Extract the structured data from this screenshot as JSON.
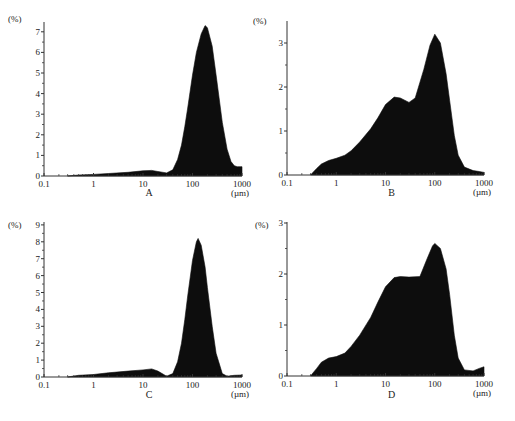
{
  "figure": {
    "panels": [
      "A",
      "B",
      "C",
      "D"
    ]
  },
  "chart_data": [
    {
      "id": "A",
      "type": "area",
      "title": "",
      "caption": "A",
      "xlabel": "(µm)",
      "ylabel": "(%)",
      "xscale": "log",
      "xlim": [
        0.1,
        1000
      ],
      "ylim": [
        0,
        7.5
      ],
      "xticks": [
        0.1,
        1,
        10,
        100,
        1000
      ],
      "xtick_labels": [
        "0.1",
        "1",
        "10",
        "100",
        "1000"
      ],
      "yticks": [
        0,
        1,
        2,
        3,
        4,
        5,
        6,
        7
      ],
      "grid": false,
      "x": [
        0.3,
        0.5,
        1,
        2,
        5,
        10,
        15,
        20,
        30,
        40,
        50,
        60,
        70,
        80,
        100,
        120,
        150,
        180,
        200,
        250,
        300,
        400,
        500,
        600,
        700,
        800,
        1000
      ],
      "values": [
        0.0,
        0.05,
        0.08,
        0.12,
        0.18,
        0.25,
        0.27,
        0.22,
        0.15,
        0.3,
        0.8,
        1.5,
        2.4,
        3.3,
        4.9,
        6.0,
        6.9,
        7.3,
        7.2,
        6.3,
        4.9,
        2.6,
        1.3,
        0.7,
        0.5,
        0.45,
        0.45
      ]
    },
    {
      "id": "B",
      "type": "area",
      "title": "",
      "caption": "B",
      "xlabel": "(µm)",
      "ylabel": "(%)",
      "xscale": "log",
      "xlim": [
        0.1,
        1000
      ],
      "ylim": [
        0,
        3.4
      ],
      "xticks": [
        0.1,
        1,
        10,
        100,
        1000
      ],
      "xtick_labels": [
        "0.1",
        "1",
        "10",
        "100",
        "1000"
      ],
      "yticks": [
        0,
        1,
        2,
        3
      ],
      "grid": false,
      "x": [
        0.3,
        0.4,
        0.5,
        0.7,
        1,
        1.5,
        2,
        3,
        5,
        7,
        10,
        15,
        20,
        30,
        40,
        60,
        80,
        100,
        130,
        170,
        200,
        250,
        300,
        400,
        600,
        800,
        1000
      ],
      "values": [
        0.0,
        0.15,
        0.25,
        0.33,
        0.38,
        0.45,
        0.55,
        0.75,
        1.05,
        1.3,
        1.6,
        1.77,
        1.75,
        1.65,
        1.75,
        2.4,
        2.95,
        3.2,
        3.0,
        2.3,
        1.7,
        0.9,
        0.45,
        0.18,
        0.1,
        0.08,
        0.06
      ]
    },
    {
      "id": "C",
      "type": "area",
      "title": "",
      "caption": "C",
      "xlabel": "(µm)",
      "ylabel": "(%)",
      "xscale": "log",
      "xlim": [
        0.1,
        1000
      ],
      "ylim": [
        0,
        9
      ],
      "xticks": [
        0.1,
        1,
        10,
        100,
        1000
      ],
      "xtick_labels": [
        "0.1",
        "1",
        "10",
        "100",
        "1000"
      ],
      "yticks": [
        0,
        1,
        2,
        3,
        4,
        5,
        6,
        7,
        8,
        9
      ],
      "grid": false,
      "x": [
        0.3,
        0.5,
        1,
        2,
        5,
        10,
        15,
        20,
        30,
        40,
        50,
        60,
        70,
        80,
        100,
        120,
        130,
        150,
        180,
        200,
        250,
        300,
        400,
        500,
        700,
        1000
      ],
      "values": [
        0.0,
        0.1,
        0.15,
        0.25,
        0.35,
        0.42,
        0.48,
        0.35,
        0.05,
        0.2,
        0.9,
        2.0,
        3.4,
        4.8,
        6.9,
        8.0,
        8.2,
        7.8,
        6.5,
        5.3,
        3.0,
        1.4,
        0.2,
        0.05,
        0.1,
        0.12
      ]
    },
    {
      "id": "D",
      "type": "area",
      "title": "",
      "caption": "D",
      "xlabel": "(µm)",
      "ylabel": "(%)",
      "xscale": "log",
      "xlim": [
        0.1,
        1000
      ],
      "ylim": [
        0,
        3
      ],
      "xticks": [
        0.1,
        1,
        10,
        100,
        1000
      ],
      "xtick_labels": [
        "0.1",
        "1",
        "10",
        "100",
        "1000"
      ],
      "yticks": [
        0,
        1,
        2,
        3
      ],
      "grid": false,
      "x": [
        0.3,
        0.4,
        0.5,
        0.7,
        1,
        1.5,
        2,
        3,
        5,
        7,
        10,
        15,
        20,
        30,
        50,
        70,
        90,
        100,
        130,
        170,
        200,
        250,
        300,
        400,
        600,
        800,
        1000
      ],
      "values": [
        0.0,
        0.15,
        0.27,
        0.35,
        0.38,
        0.45,
        0.58,
        0.8,
        1.15,
        1.45,
        1.75,
        1.93,
        1.95,
        1.94,
        1.95,
        2.3,
        2.55,
        2.6,
        2.5,
        2.1,
        1.6,
        0.8,
        0.35,
        0.12,
        0.1,
        0.15,
        0.18
      ]
    }
  ]
}
